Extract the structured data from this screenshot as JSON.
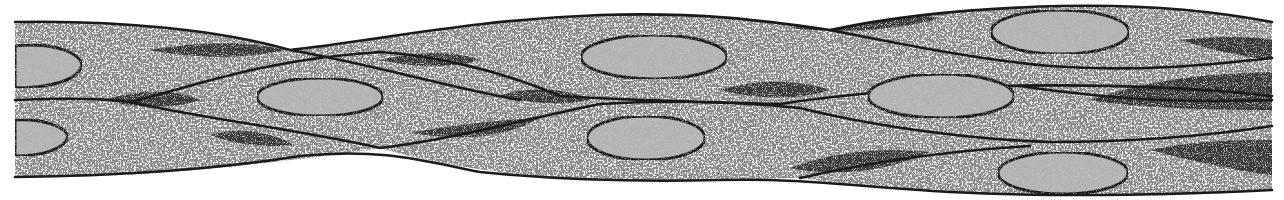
{
  "figure": {
    "colors": {
      "background": "#ffffff",
      "cytoplasm": "#8a8a8a",
      "cytoplasm_speckle": "#d8d8d8",
      "tapered_ends": "#3a3a3a",
      "nucleus_fill": "#b4b4b4",
      "outline": "#1a1a1a"
    },
    "nuclei": [
      {
        "id": "n1",
        "cx": 40,
        "cy": 66,
        "rx": 42,
        "ry": 21
      },
      {
        "id": "n2",
        "cx": 32,
        "cy": 136,
        "rx": 36,
        "ry": 18
      },
      {
        "id": "n3",
        "cx": 320,
        "cy": 97,
        "rx": 63,
        "ry": 19
      },
      {
        "id": "n4",
        "cx": 654,
        "cy": 57,
        "rx": 73,
        "ry": 22
      },
      {
        "id": "n5",
        "cx": 646,
        "cy": 138,
        "rx": 59,
        "ry": 22
      },
      {
        "id": "n6",
        "cx": 1060,
        "cy": 32,
        "rx": 69,
        "ry": 22
      },
      {
        "id": "n7",
        "cx": 941,
        "cy": 96,
        "rx": 73,
        "ry": 22
      },
      {
        "id": "n8",
        "cx": 1063,
        "cy": 173,
        "rx": 65,
        "ry": 21
      }
    ]
  }
}
